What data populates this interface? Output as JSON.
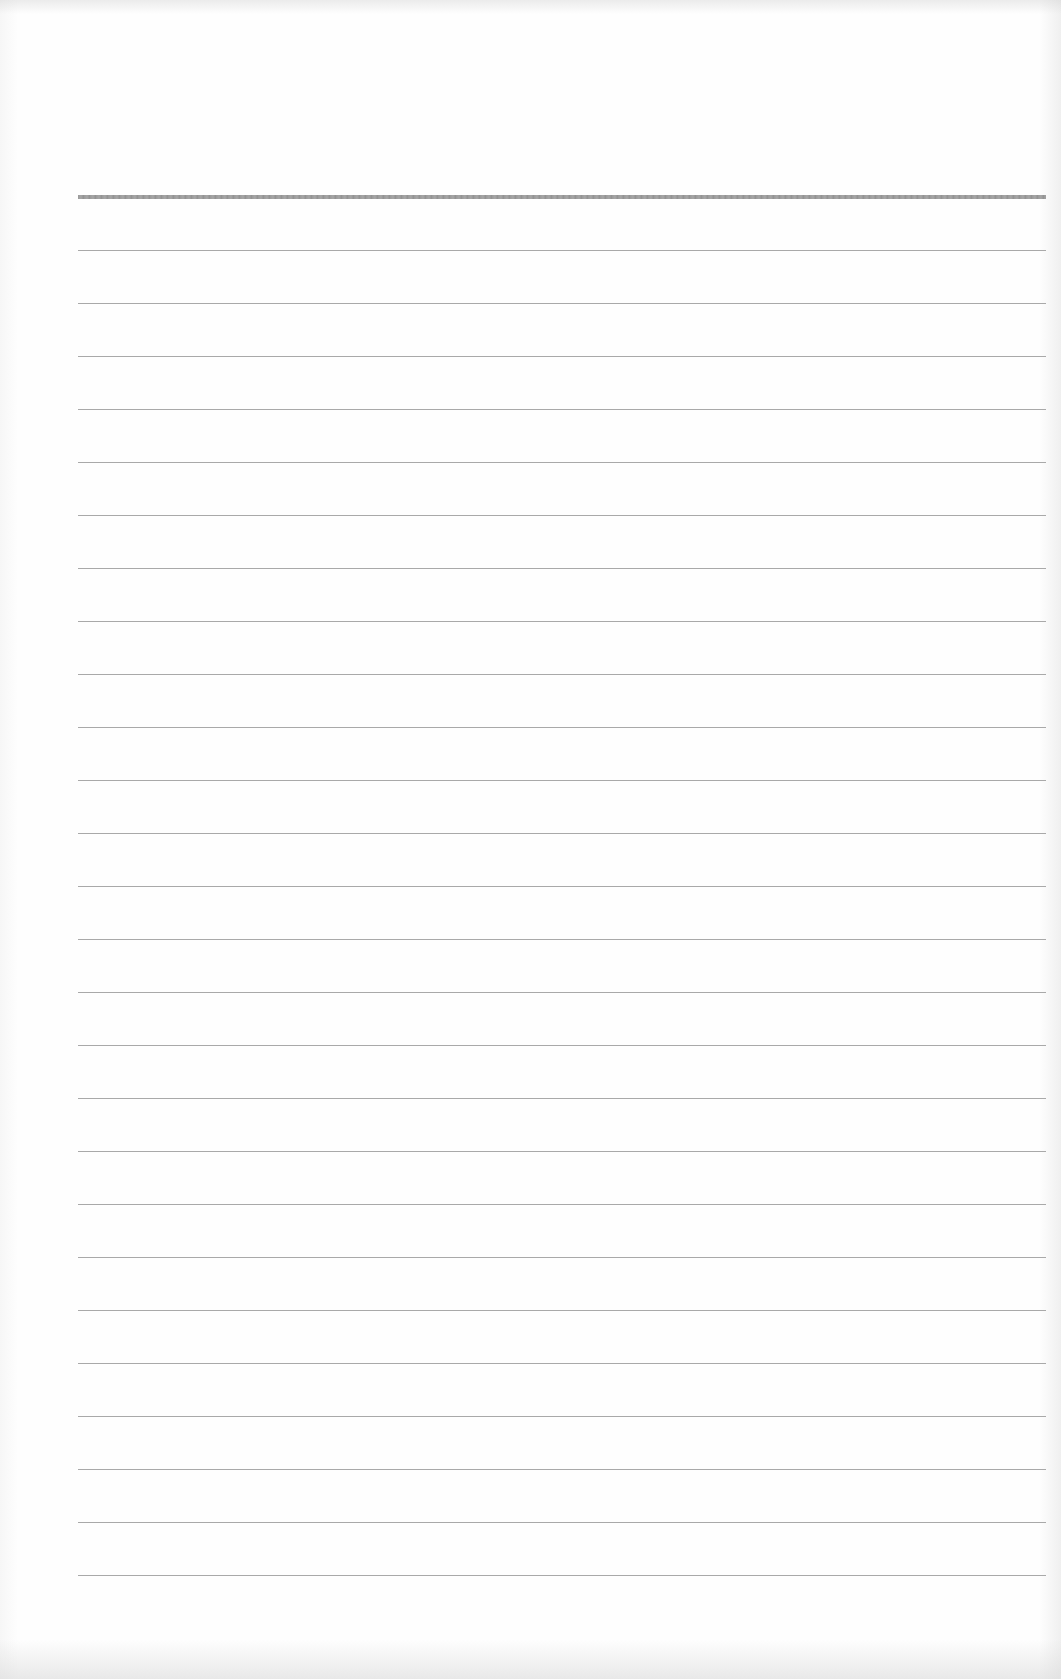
{
  "document": {
    "type": "blank ruled sheet",
    "header_rule": {
      "y": 195,
      "thickness": 4,
      "color": "#9a9a9a"
    },
    "rules": {
      "count": 26,
      "first_y": 250,
      "spacing": 53,
      "left": 78,
      "right": 1046,
      "color": "#a9a9a9"
    },
    "text": ""
  }
}
